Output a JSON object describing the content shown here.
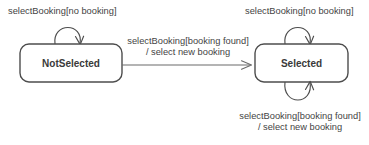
{
  "diagram": {
    "type": "uml-state-machine",
    "title": "",
    "background_color": "#ffffff",
    "line_color": "#4d4d4d",
    "text_color": "#444444",
    "state_label_color": "#3a3a3a",
    "states": [
      {
        "id": "not-selected",
        "label": "NotSelected",
        "x": 20,
        "y": 44,
        "width": 102,
        "height": 38
      },
      {
        "id": "selected",
        "label": "Selected",
        "x": 255,
        "y": 44,
        "width": 93,
        "height": 38
      }
    ],
    "transitions": [
      {
        "id": "not-selected-self-loop",
        "from": "not-selected",
        "to": "not-selected",
        "kind": "self-loop-top",
        "label_lines": [
          "selectBooking[no booking]"
        ],
        "label_x": 8,
        "label_y": 14
      },
      {
        "id": "not-selected-to-selected",
        "from": "not-selected",
        "to": "selected",
        "kind": "straight",
        "label_lines": [
          "selectBooking[booking found]",
          "/ select new booking"
        ],
        "label_x": 188,
        "label_y": 44
      },
      {
        "id": "selected-self-loop-top",
        "from": "selected",
        "to": "selected",
        "kind": "self-loop-top",
        "label_lines": [
          "selectBooking[no booking]"
        ],
        "label_x": 245,
        "label_y": 14
      },
      {
        "id": "selected-self-loop-bottom",
        "from": "selected",
        "to": "selected",
        "kind": "self-loop-bottom",
        "label_lines": [
          "selectBooking[booking found]",
          "/ select new booking"
        ],
        "label_x": 300,
        "label_y": 119
      }
    ]
  }
}
